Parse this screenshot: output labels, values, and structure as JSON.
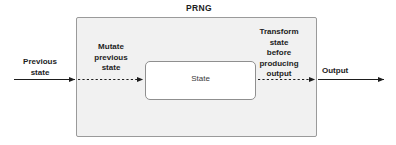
{
  "diagram": {
    "title": "PRNG",
    "outer_box": {
      "label": "PRNG",
      "fill_color": "#f1f1f1",
      "border_color": "#9a9a9a"
    },
    "inner_box": {
      "label": "State",
      "fill_color": "#ffffff",
      "border_color": "#8f8f8f"
    },
    "labels": {
      "previous_state": "Previous\nstate",
      "mutate_previous_state": "Mutate\nprevious\nstate",
      "transform_state": "Transform\nstate\nbefore\nproducing\noutput",
      "output": "Output"
    },
    "arrows": [
      {
        "name": "input-arrow",
        "style": "solid",
        "from": "previous-state",
        "to": "prng-box-left-edge",
        "color": "#1d1d1d"
      },
      {
        "name": "mutate-arrow",
        "style": "dashed",
        "from": "prng-box-left-edge",
        "to": "state-box-left-edge",
        "color": "#1d1d1d"
      },
      {
        "name": "transform-arrow",
        "style": "dashed",
        "from": "state-box-right-edge",
        "to": "prng-box-right-edge",
        "color": "#1d1d1d"
      },
      {
        "name": "output-arrow",
        "style": "solid",
        "from": "prng-box-right-edge",
        "to": "output",
        "color": "#1d1d1d"
      }
    ]
  }
}
